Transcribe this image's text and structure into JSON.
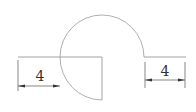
{
  "diagram": {
    "type": "technical-drawing",
    "colors": {
      "outline": "#8a8a8a",
      "dimension": "#555555",
      "text": "#333333"
    },
    "dimensions": [
      {
        "id": "left",
        "label": "4"
      },
      {
        "id": "right",
        "label": "4"
      }
    ]
  }
}
